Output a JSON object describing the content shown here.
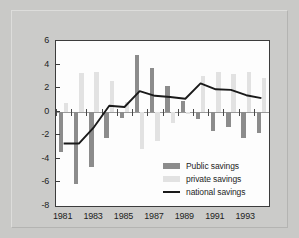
{
  "chart_data": {
    "type": "bar",
    "title": "",
    "subtitle": "",
    "xlabel": "",
    "ylabel": "",
    "ylim": [
      -8,
      6
    ],
    "yticks": [
      6,
      4,
      2,
      0,
      -2,
      -4,
      -6,
      -8
    ],
    "ytick_labels": [
      "6",
      "4",
      "2",
      "0",
      "-2",
      "-4",
      "-6",
      "-8"
    ],
    "grid": false,
    "legend_position": "inside-bottom-right",
    "categories": [
      1981,
      1982,
      1983,
      1984,
      1985,
      1986,
      1987,
      1988,
      1989,
      1990,
      1991,
      1992,
      1993,
      1994
    ],
    "xtick_labels": [
      "1981",
      "1983",
      "1985",
      "1987",
      "1989",
      "1991",
      "1993"
    ],
    "xticks": [
      1981,
      1983,
      1985,
      1987,
      1989,
      1991,
      1993
    ],
    "series": [
      {
        "name": "Public savings",
        "kind": "bar",
        "color": "#8c8c8c",
        "values": [
          -3.4,
          -6.1,
          -4.7,
          -2.2,
          -0.5,
          4.8,
          3.7,
          2.2,
          0.9,
          -0.6,
          -1.6,
          -1.3,
          -2.2,
          -1.8
        ]
      },
      {
        "name": "private savings",
        "kind": "bar",
        "color": "#e2e2e2",
        "values": [
          0.7,
          3.3,
          3.4,
          2.6,
          0.8,
          -3.2,
          -2.5,
          -1.0,
          -0.2,
          3.0,
          3.4,
          3.2,
          3.4,
          2.9
        ]
      },
      {
        "name": "national savings",
        "kind": "line",
        "color": "#1a1a1a",
        "values": [
          -2.7,
          -2.7,
          -1.3,
          0.5,
          0.4,
          1.75,
          1.35,
          1.25,
          1.1,
          2.4,
          1.9,
          1.85,
          1.4,
          1.15
        ]
      }
    ]
  },
  "legend": {
    "items": [
      {
        "label": "Public savings"
      },
      {
        "label": "private savings"
      },
      {
        "label": "national savings"
      }
    ]
  },
  "colors": {
    "background": "#c9c9c7",
    "plot_background": "#fdfdfd",
    "axis": "#3c3c3c",
    "public": "#8c8c8c",
    "private": "#e2e2e2",
    "national": "#1a1a1a"
  }
}
